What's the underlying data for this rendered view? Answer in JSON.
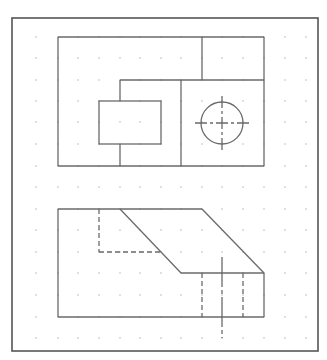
{
  "drawing": {
    "title": "Orthographic projection: top view and front view",
    "colors": {
      "frame": "#555555",
      "line": "#6a6a6a",
      "grid": "#b8b8b8",
      "background": "#ffffff"
    },
    "frame": {
      "x": 12,
      "y": 18,
      "w": 306,
      "h": 333
    },
    "grid": {
      "xs": [
        36,
        58,
        78,
        99,
        120,
        140,
        161,
        181,
        202,
        222,
        243,
        264,
        285,
        306
      ],
      "ys": [
        37,
        58,
        80,
        101,
        122,
        144,
        166,
        187,
        209,
        230,
        252,
        273,
        295,
        317,
        338
      ]
    },
    "top_view": {
      "solid_lines": [
        [
          58,
          37,
          264,
          37
        ],
        [
          58,
          37,
          58,
          166
        ],
        [
          264,
          37,
          264,
          166
        ],
        [
          58,
          166,
          264,
          166
        ],
        [
          202,
          37,
          202,
          80
        ],
        [
          120,
          80,
          264,
          80
        ],
        [
          120,
          80,
          120,
          101
        ],
        [
          120,
          144,
          120,
          166
        ],
        [
          181,
          80,
          181,
          166
        ]
      ],
      "rects": [
        {
          "x": 99,
          "y": 101,
          "w": 62,
          "h": 43
        }
      ],
      "hole": {
        "cx": 222,
        "cy": 123,
        "r": 21
      },
      "center_lines": [
        [
          195,
          123,
          249,
          123
        ],
        [
          222,
          96,
          222,
          150
        ]
      ]
    },
    "front_view": {
      "solid_lines": [
        [
          58,
          209,
          202,
          209
        ],
        [
          58,
          209,
          58,
          317
        ],
        [
          58,
          317,
          264,
          317
        ],
        [
          264,
          273,
          264,
          317
        ],
        [
          120,
          209,
          181,
          273
        ],
        [
          202,
          209,
          264,
          273
        ],
        [
          181,
          273,
          264,
          273
        ]
      ],
      "hidden_lines": [
        [
          99,
          209,
          99,
          252
        ],
        [
          99,
          252,
          161,
          252
        ],
        [
          202,
          273,
          202,
          317
        ],
        [
          243,
          273,
          243,
          317
        ]
      ],
      "center_lines": [
        [
          222,
          257,
          222,
          338
        ]
      ]
    }
  }
}
